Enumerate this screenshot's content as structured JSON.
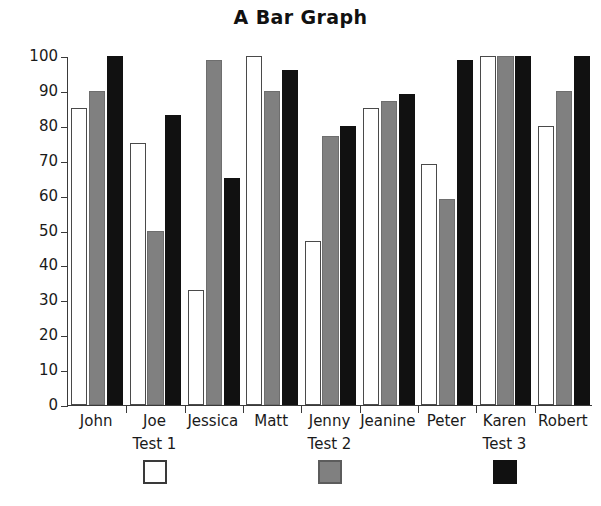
{
  "chart_data": {
    "type": "bar",
    "title": "A Bar Graph",
    "xlabel": "",
    "ylabel": "",
    "ylim": [
      0,
      100
    ],
    "yticks": [
      0,
      10,
      20,
      30,
      40,
      50,
      60,
      70,
      80,
      90,
      100
    ],
    "grid": false,
    "legend_position": "bottom",
    "categories": [
      "John",
      "Joe",
      "Jessica",
      "Matt",
      "Jenny",
      "Jeanine",
      "Peter",
      "Karen",
      "Robert"
    ],
    "series": [
      {
        "name": "Test 1",
        "color": "#ffffff",
        "values": [
          85,
          75,
          33,
          100,
          47,
          85,
          69,
          100,
          80
        ]
      },
      {
        "name": "Test 2",
        "color": "#808080",
        "values": [
          90,
          50,
          99,
          90,
          77,
          87,
          59,
          100,
          90
        ]
      },
      {
        "name": "Test 3",
        "color": "#111111",
        "values": [
          100,
          83,
          65,
          96,
          80,
          89,
          99,
          100,
          100
        ]
      }
    ]
  },
  "legend": {
    "entries": [
      {
        "label": "Test 1",
        "swatch": "white-square-swatch",
        "anchor_category": "Joe"
      },
      {
        "label": "Test 2",
        "swatch": "gray-square-swatch",
        "anchor_category": "Jenny"
      },
      {
        "label": "Test 3",
        "swatch": "black-square-swatch",
        "anchor_category": "Karen"
      }
    ]
  },
  "colors": {
    "series_1": "#ffffff",
    "series_2": "#808080",
    "series_3": "#111111",
    "axis": "#3a3a3a",
    "text": "#1a1a1a",
    "background": "#ffffff"
  }
}
